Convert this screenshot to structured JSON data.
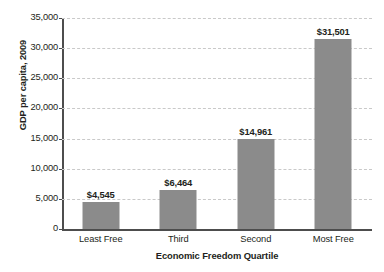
{
  "chart_data": {
    "type": "bar",
    "title": "",
    "categories": [
      "Least Free",
      "Third",
      "Second",
      "Most Free"
    ],
    "values": [
      4545,
      6464,
      14961,
      31501
    ],
    "value_labels": [
      "$4,545",
      "$6,464",
      "$14,961",
      "$31,501"
    ],
    "xlabel": "Economic Freedom Quartile",
    "ylabel": "GDP per capita, 2009",
    "ylim": [
      0,
      35000
    ],
    "ytick_step": 5000,
    "ytick_labels": [
      "0",
      "5,000",
      "10,000",
      "15,000",
      "20,000",
      "25,000",
      "30,000",
      "35,000"
    ],
    "ytick_values": [
      0,
      5000,
      10000,
      15000,
      20000,
      25000,
      30000,
      35000
    ],
    "grid": "horizontal-dashed",
    "legend": "none",
    "bar_color": "#8b8b8b",
    "axis_color": "#4d4d4d",
    "grid_color": "#c9c9c9",
    "text_color": "#231f20"
  }
}
